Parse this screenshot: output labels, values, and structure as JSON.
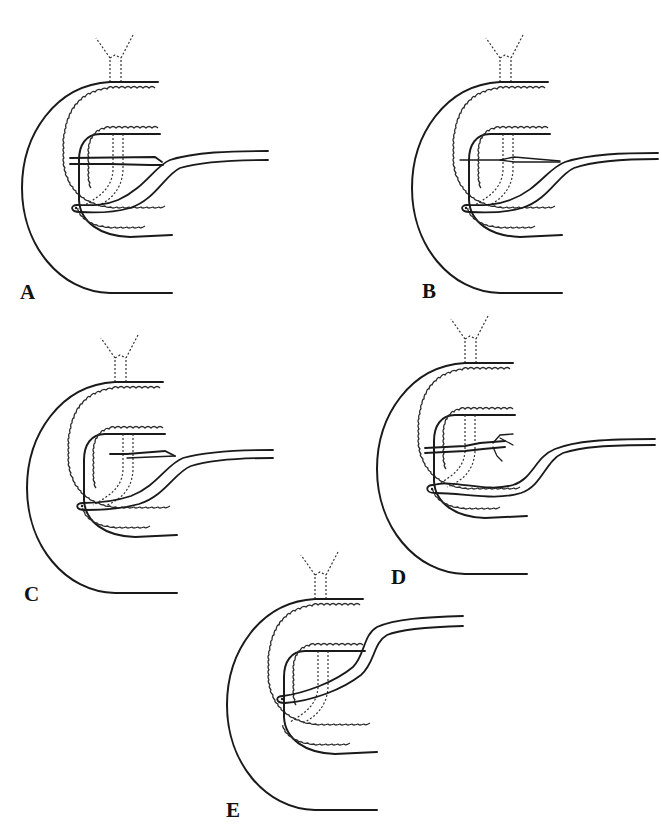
{
  "figure": {
    "background": "#ffffff",
    "line_color": "#1a1a1a",
    "panels": [
      {
        "id": "A",
        "label": "A",
        "variant": "bifid duct, dorsal duct reaching duodenal wall, main duct to major papilla"
      },
      {
        "id": "B",
        "label": "B",
        "variant": "thin dorsal duct crossing to duodenal wall, main duct to major papilla"
      },
      {
        "id": "C",
        "label": "C",
        "variant": "dorsal duct ending blindly before duodenal wall, main duct to major papilla"
      },
      {
        "id": "D",
        "label": "D",
        "variant": "separate small dorsal duct with branching, ventral main duct to major papilla"
      },
      {
        "id": "E",
        "label": "E",
        "variant": "single main duct to major papilla, no dorsal duct"
      }
    ]
  }
}
